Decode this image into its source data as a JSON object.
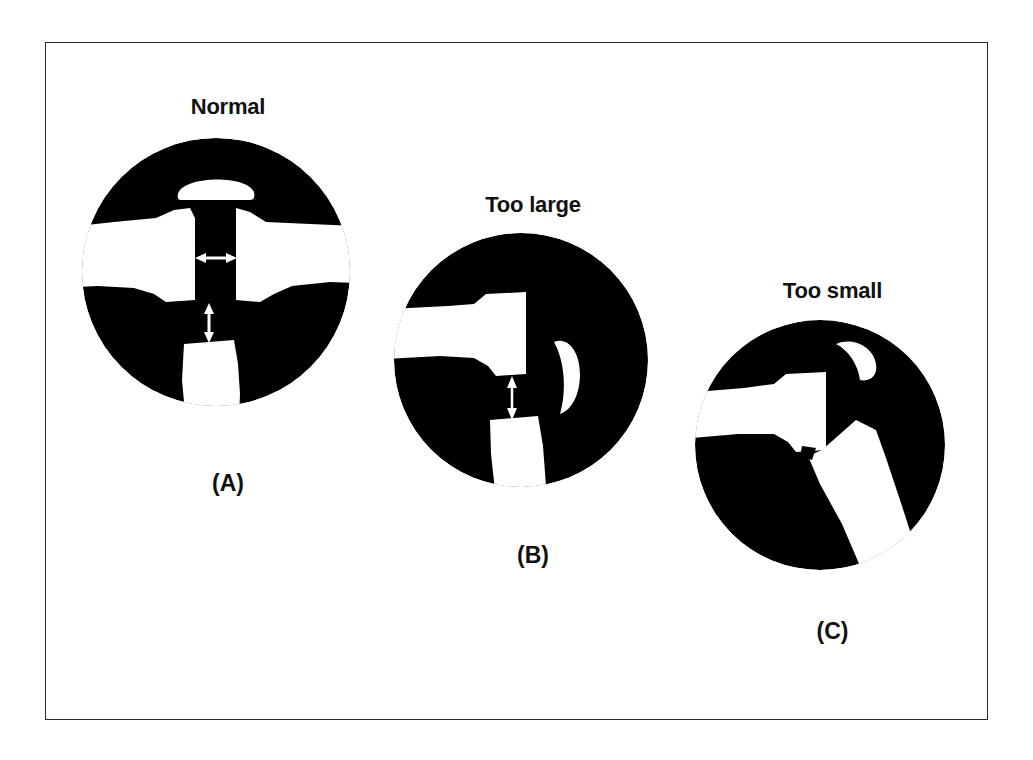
{
  "figure": {
    "background_color": "#ffffff",
    "border_color": "#2b2b2b",
    "ink_color": "#000000",
    "highlight_color": "#ffffff"
  },
  "panels": [
    {
      "id": "A",
      "title": "Normal",
      "caption": "(A)",
      "annotations": {
        "horizontal_arrow": "horizontal-double-arrow",
        "vertical_arrow": "vertical-double-arrow"
      }
    },
    {
      "id": "B",
      "title": "Too large",
      "caption": "(B)",
      "annotations": {
        "vertical_arrow": "vertical-double-arrow"
      }
    },
    {
      "id": "C",
      "title": "Too small",
      "caption": "(C)",
      "annotations": {}
    }
  ]
}
